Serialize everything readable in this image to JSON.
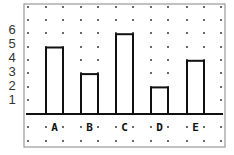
{
  "chart_data": {
    "type": "bar",
    "title": "",
    "xlabel": "",
    "ylabel": "",
    "categories": [
      "A",
      "B",
      "C",
      "D",
      "E"
    ],
    "values": [
      5,
      3,
      6,
      2,
      4
    ],
    "y_ticks": [
      "1",
      "2",
      "3",
      "4",
      "5",
      "6"
    ],
    "ylim": [
      0,
      6
    ],
    "grid": "dot-grid",
    "legend": null,
    "colors": {
      "bar_fill": "#ffffff",
      "bar_stroke": "#111111",
      "frame": "#888888",
      "dots": "#222222"
    }
  }
}
